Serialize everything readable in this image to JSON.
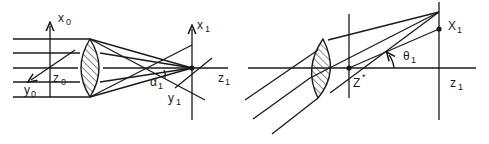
{
  "figure": {
    "left_panel": {
      "labels": {
        "x0": "x",
        "x0_sub": "0",
        "z0": "z",
        "z0_sub": "0",
        "y0": "y",
        "y0_sub": "0",
        "x1": "x",
        "x1_sub": "1",
        "z1": "z",
        "z1_sub": "1",
        "y1": "y",
        "y1_sub": "1",
        "alpha1": "α",
        "alpha1_sub": "1"
      },
      "parallel_ray_count": 5
    },
    "right_panel": {
      "labels": {
        "X1": "X",
        "X1_sub": "1",
        "z1": "z",
        "z1_sub": "1",
        "theta1": "θ",
        "theta1_sub": "1",
        "zstar": "Z",
        "zstar_sup": "*"
      },
      "oblique_ray_count": 3
    },
    "colors": {
      "ink": "#1a1a1a",
      "background": "#ffffff"
    }
  }
}
